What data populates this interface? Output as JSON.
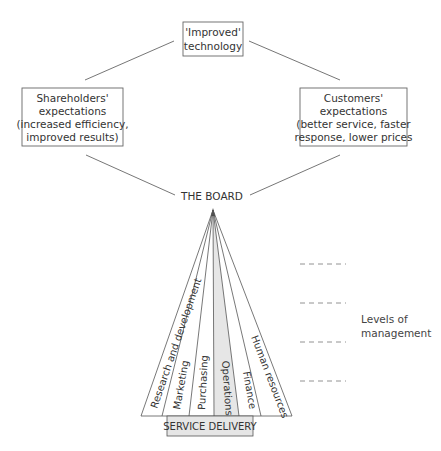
{
  "diagram": {
    "top_box": {
      "lines": [
        "'Improved'",
        "technology"
      ]
    },
    "left_box": {
      "lines": [
        "Shareholders'",
        "expectations",
        "(increased efficiency,",
        "improved results)"
      ]
    },
    "right_box": {
      "lines": [
        "Customers'",
        "expectations",
        "(better service, faster",
        "response, lower prices"
      ]
    },
    "board_label": "THE BOARD",
    "departments": [
      {
        "label": "Research and development"
      },
      {
        "label": "Marketing"
      },
      {
        "label": "Purchasing"
      },
      {
        "label": "Operations",
        "highlighted": true
      },
      {
        "label": "Finance"
      },
      {
        "label": "Human resources"
      }
    ],
    "service_delivery": "SERVICE DELIVERY",
    "levels_label": [
      "Levels of",
      "management"
    ],
    "level_lines_count": 4,
    "colors": {
      "stroke": "#555555",
      "highlight_fill": "#e6e6e6",
      "text": "#333333"
    }
  }
}
